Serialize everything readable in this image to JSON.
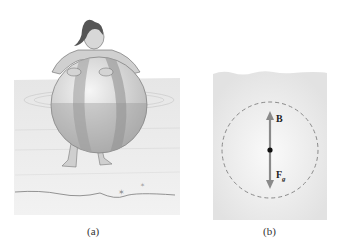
{
  "figure": {
    "panels": [
      {
        "id": "a",
        "caption": "(a)",
        "description": "Person leaning on a beach ball floating in shallow water"
      },
      {
        "id": "b",
        "caption": "(b)",
        "description": "Free-body diagram of submerged sphere with buoyant force and gravitational force",
        "vectors": [
          {
            "label": "B",
            "direction": "up"
          },
          {
            "label_main": "F",
            "label_sub": "g",
            "direction": "down"
          }
        ]
      }
    ],
    "colors": {
      "water_panel": "#e4e4e4",
      "arrow": "#8a8a8a",
      "dashed_circle": "#8a8a8a",
      "center_dot": "#111111"
    }
  }
}
